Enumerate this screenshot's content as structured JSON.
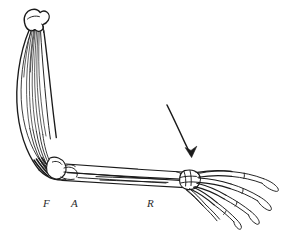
{
  "figure": {
    "background_color": "#ffffff",
    "ink_color": "#1a1a1a",
    "width": 285,
    "height": 232
  },
  "labels": [
    {
      "id": "flexor",
      "text": "F",
      "x": 43,
      "y": 198,
      "meaning": "flexor-muscle-label"
    },
    {
      "id": "antebrachium",
      "text": "A",
      "x": 71,
      "y": 198,
      "meaning": "ulna-label"
    },
    {
      "id": "radius",
      "text": "R",
      "x": 147,
      "y": 198,
      "meaning": "radius-label"
    }
  ],
  "annotations": {
    "motion_arrow": {
      "name": "downward-motion-arrow",
      "description": "curved arrow indicating downward extension movement",
      "start": [
        167,
        105
      ],
      "end": [
        191,
        156
      ]
    }
  },
  "parts": {
    "humerus": "upper arm bone with rounded proximal head",
    "muscle": "long flexor muscle belly with striated fibers",
    "elbow": "elbow joint with olecranon",
    "ulna": "forearm bone, lower",
    "radius": "forearm bone, upper",
    "carpals": "wrist bone cluster",
    "metacarpals": "palm bones",
    "phalanges": "five digits"
  }
}
